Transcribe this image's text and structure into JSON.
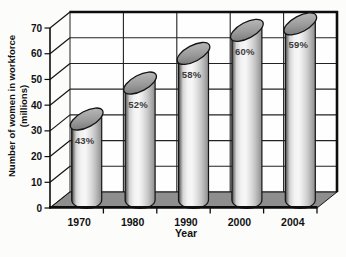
{
  "chart_data": {
    "type": "bar",
    "subtype": "3d-cylinder",
    "title": "",
    "xlabel": "Year",
    "ylabel": "Number of women in workforce",
    "ylabel_line2": "(millions)",
    "categories": [
      "1970",
      "1980",
      "1990",
      "2000",
      "2004"
    ],
    "values": [
      31.5,
      45.5,
      57,
      66,
      68.5
    ],
    "bar_labels": [
      "43%",
      "52%",
      "58%",
      "60%",
      "59%"
    ],
    "yticks": [
      0,
      10,
      20,
      30,
      40,
      50,
      60,
      70
    ],
    "ylim": [
      0,
      70
    ],
    "grid": true,
    "legend": false,
    "colors": {
      "background": "#fcfcfa",
      "wall": "#fefefe",
      "floor": "#8e8e8e",
      "grid_line": "#222222",
      "border": "#0d0d0d",
      "outline": "#141414",
      "bar_light": "#f7f7f7",
      "bar_dark": "#2e2e2e",
      "cap_dark": "#6e6e6e",
      "cap_light": "#c2c2c2",
      "axis_text": "#111111",
      "bar_label_text": "#3c3c3c"
    }
  }
}
